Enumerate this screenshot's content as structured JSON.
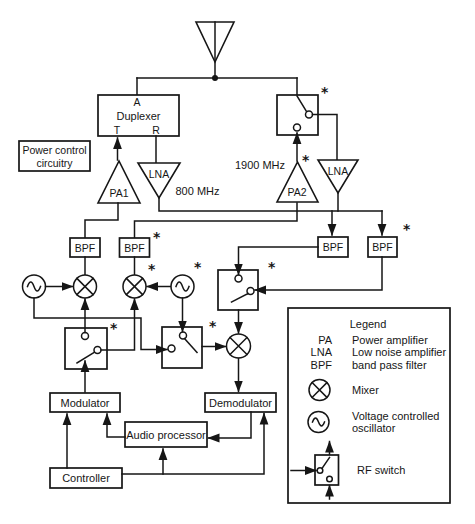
{
  "diagram": {
    "asterisk": "*",
    "duplexer": {
      "port_a": "A",
      "title": "Duplexer",
      "port_t": "T",
      "port_r": "R"
    },
    "power_control": {
      "line1": "Power control",
      "line2": "circuitry"
    },
    "amplifiers": {
      "pa1": "PA1",
      "lna_800": "LNA",
      "pa2": "PA2",
      "lna_1900": "LNA"
    },
    "frequencies": {
      "band_800": "800 MHz",
      "band_1900": "1900 MHz"
    },
    "filter_label": "BPF",
    "blocks": {
      "modulator": "Modulator",
      "demodulator": "Demodulator",
      "audio_processor": "Audio processor",
      "controller": "Controller"
    }
  },
  "legend": {
    "title": "Legend",
    "rows": [
      {
        "abbr": "PA",
        "desc": "Power amplifier"
      },
      {
        "abbr": "LNA",
        "desc": "Low noise amplifier"
      },
      {
        "abbr": "BPF",
        "desc": "band pass filter"
      }
    ],
    "mixer_label": "Mixer",
    "vco_label_line1": "Voltage controlled",
    "vco_label_line2": "oscillator",
    "rf_switch_label": "RF switch"
  }
}
